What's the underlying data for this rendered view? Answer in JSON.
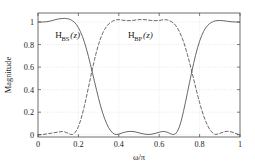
{
  "chart_data": {
    "type": "line",
    "title": "",
    "xlabel": "ω/π",
    "ylabel": "Magnitude",
    "xlim": [
      0,
      1
    ],
    "ylim": [
      -0.02,
      1.08
    ],
    "xticks": [
      "0",
      "0.2",
      "0.4",
      "0.6",
      "0.8",
      "1"
    ],
    "xtick_values": [
      0,
      0.2,
      0.4,
      0.6,
      0.8,
      1
    ],
    "yticks": [
      "0",
      "0.2",
      "0.4",
      "0.6",
      "0.8",
      "1"
    ],
    "ytick_values": [
      0,
      0.2,
      0.4,
      0.6,
      0.8,
      1
    ],
    "grid": true,
    "legend_position": "inline-annotation",
    "annotations": [
      {
        "name": "bandstop-label",
        "base": "H",
        "subscript": "BS",
        "suffix": "(z)",
        "x": 0.085,
        "y": 0.855
      },
      {
        "name": "bandpass-label",
        "base": "H",
        "subscript": "BP",
        "suffix": "(z)",
        "x": 0.445,
        "y": 0.855
      }
    ],
    "series": [
      {
        "name": "H_BS(z)",
        "style": "solid",
        "color": "#4d4d4d",
        "x": [
          0,
          0.02,
          0.04,
          0.06,
          0.08,
          0.1,
          0.12,
          0.13,
          0.14,
          0.15,
          0.16,
          0.17,
          0.18,
          0.19,
          0.2,
          0.21,
          0.22,
          0.23,
          0.24,
          0.25,
          0.26,
          0.27,
          0.28,
          0.29,
          0.3,
          0.31,
          0.32,
          0.33,
          0.34,
          0.35,
          0.36,
          0.37,
          0.38,
          0.39,
          0.4,
          0.42,
          0.44,
          0.46,
          0.48,
          0.5,
          0.52,
          0.54,
          0.56,
          0.58,
          0.6,
          0.61,
          0.62,
          0.63,
          0.64,
          0.65,
          0.66,
          0.67,
          0.68,
          0.69,
          0.7,
          0.71,
          0.72,
          0.73,
          0.74,
          0.75,
          0.76,
          0.77,
          0.78,
          0.79,
          0.8,
          0.81,
          0.82,
          0.83,
          0.84,
          0.85,
          0.86,
          0.87,
          0.88,
          0.9,
          0.92,
          0.94,
          0.96,
          0.98,
          1
        ],
        "y": [
          1.0,
          1.0,
          1.002,
          1.008,
          1.018,
          1.027,
          1.031,
          1.032,
          1.031,
          1.028,
          1.022,
          1.012,
          0.998,
          0.978,
          0.95,
          0.915,
          0.872,
          0.82,
          0.76,
          0.693,
          0.62,
          0.545,
          0.47,
          0.395,
          0.322,
          0.255,
          0.195,
          0.142,
          0.098,
          0.062,
          0.034,
          0.015,
          0.005,
          0.002,
          0.006,
          0.018,
          0.027,
          0.03,
          0.026,
          0.017,
          0.008,
          0.003,
          0.004,
          0.012,
          0.022,
          0.027,
          0.029,
          0.027,
          0.022,
          0.014,
          0.006,
          0.002,
          0.008,
          0.03,
          0.07,
          0.13,
          0.205,
          0.288,
          0.375,
          0.462,
          0.548,
          0.63,
          0.705,
          0.772,
          0.83,
          0.878,
          0.917,
          0.948,
          0.97,
          0.987,
          0.998,
          1.006,
          1.011,
          1.014,
          1.011,
          1.006,
          1.002,
          1.0,
          1.0
        ]
      },
      {
        "name": "H_BP(z)",
        "style": "dashed",
        "color": "#4d4d4d",
        "x": [
          0,
          0.02,
          0.04,
          0.06,
          0.08,
          0.1,
          0.11,
          0.12,
          0.13,
          0.14,
          0.15,
          0.16,
          0.17,
          0.18,
          0.19,
          0.2,
          0.21,
          0.22,
          0.23,
          0.24,
          0.25,
          0.26,
          0.27,
          0.28,
          0.29,
          0.3,
          0.31,
          0.32,
          0.33,
          0.34,
          0.35,
          0.36,
          0.37,
          0.38,
          0.39,
          0.4,
          0.42,
          0.44,
          0.46,
          0.48,
          0.5,
          0.52,
          0.54,
          0.56,
          0.58,
          0.6,
          0.61,
          0.62,
          0.63,
          0.64,
          0.65,
          0.66,
          0.67,
          0.68,
          0.69,
          0.7,
          0.71,
          0.72,
          0.73,
          0.74,
          0.75,
          0.76,
          0.77,
          0.78,
          0.79,
          0.8,
          0.81,
          0.82,
          0.83,
          0.84,
          0.85,
          0.86,
          0.87,
          0.88,
          0.9,
          0.92,
          0.94,
          0.96,
          0.98,
          1
        ],
        "y": [
          0.0,
          0.002,
          0.006,
          0.012,
          0.018,
          0.024,
          0.027,
          0.028,
          0.026,
          0.02,
          0.012,
          0.004,
          0.002,
          0.012,
          0.035,
          0.072,
          0.122,
          0.185,
          0.258,
          0.338,
          0.422,
          0.507,
          0.59,
          0.668,
          0.74,
          0.803,
          0.857,
          0.9,
          0.935,
          0.962,
          0.982,
          0.997,
          1.008,
          1.016,
          1.02,
          1.021,
          1.016,
          1.012,
          1.013,
          1.017,
          1.021,
          1.022,
          1.019,
          1.014,
          1.012,
          1.014,
          1.017,
          1.02,
          1.021,
          1.018,
          1.012,
          1.004,
          0.992,
          0.973,
          0.948,
          0.915,
          0.875,
          0.828,
          0.772,
          0.71,
          0.642,
          0.57,
          0.497,
          0.423,
          0.352,
          0.285,
          0.223,
          0.168,
          0.12,
          0.08,
          0.048,
          0.024,
          0.008,
          0.002,
          0.012,
          0.026,
          0.031,
          0.024,
          0.01,
          0.0
        ]
      }
    ]
  },
  "axes": {
    "x_label": "ω/π",
    "y_label": "Magnitude"
  }
}
